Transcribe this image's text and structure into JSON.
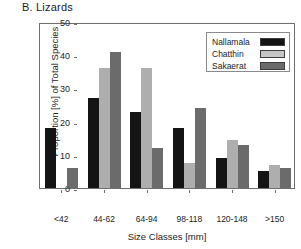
{
  "figure": {
    "panel_label": "B.  Lizards"
  },
  "chart_data": {
    "type": "bar",
    "title": "B.  Lizards",
    "xlabel": "Size Classes [mm]",
    "ylabel": "Proportion [%] of Total Species",
    "categories": [
      "<42",
      "44-62",
      "64-94",
      "98-118",
      "120-148",
      ">150"
    ],
    "ylim": [
      0,
      50
    ],
    "yticks": [
      0,
      10,
      20,
      30,
      40,
      50
    ],
    "ytick_labels": [
      "0",
      "10",
      "20",
      "30",
      "40",
      "50"
    ],
    "grid": false,
    "legend_position": "top-right",
    "series": [
      {
        "name": "Nallamala",
        "color": "#141414",
        "values": [
          18,
          27,
          23,
          18,
          9,
          5
        ]
      },
      {
        "name": "Chatthin",
        "color": "#aeaeae",
        "values": [
          0,
          36,
          36,
          7.5,
          14.5,
          7
        ]
      },
      {
        "name": "Sakaerat",
        "color": "#6b6b6b",
        "values": [
          6,
          41,
          12,
          24,
          13,
          6
        ]
      }
    ]
  }
}
